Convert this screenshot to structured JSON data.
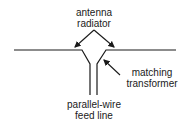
{
  "diagram": {
    "labels": {
      "antenna_radiator": [
        "antenna",
        "radiator"
      ],
      "matching_transformer": [
        "matching",
        "transformer"
      ],
      "feed_line": [
        "parallel-wire",
        "feed line"
      ]
    },
    "colors": {
      "line": "#1a1a1a",
      "background": "#ffffff"
    }
  }
}
